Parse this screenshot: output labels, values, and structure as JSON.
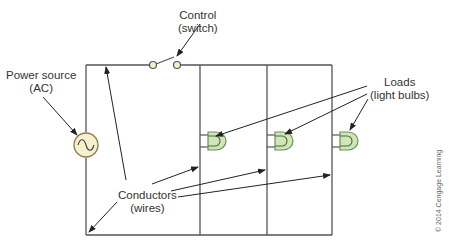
{
  "diagram": {
    "labels": {
      "control": {
        "line1": "Control",
        "line2": "(switch)"
      },
      "power_source": {
        "line1": "Power source",
        "line2": "(AC)"
      },
      "loads": {
        "line1": "Loads",
        "line2": "(light bulbs)"
      },
      "conductors": {
        "line1": "Conductors",
        "line2": "(wires)"
      }
    },
    "copyright": "© 2014 Cengage Learning",
    "colors": {
      "wire": "#555555",
      "arrow": "#222222",
      "bulb_fill": "#cfe6b8",
      "bulb_stroke": "#6a8f55",
      "source_fill": "#f7f0cc",
      "source_stroke": "#8a7a50",
      "switch_contact_fill": "#f2f0c8"
    },
    "components": {
      "power_source": {
        "type": "ac-source",
        "symbol": "sine-wave"
      },
      "switch": {
        "type": "spst-switch",
        "state": "open"
      },
      "bulbs": [
        {
          "id": 1,
          "branch": 1
        },
        {
          "id": 2,
          "branch": 2
        },
        {
          "id": 3,
          "branch": 3
        }
      ]
    }
  }
}
